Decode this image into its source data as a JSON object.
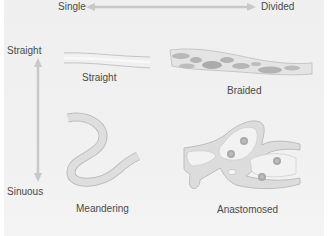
{
  "diagram": {
    "axes": {
      "horizontal": {
        "start_label": "Single",
        "end_label": "Divided"
      },
      "vertical": {
        "start_label": "Straight",
        "end_label": "Sinuous"
      }
    },
    "patterns": [
      {
        "id": "straight",
        "label": "Straight"
      },
      {
        "id": "braided",
        "label": "Braided"
      },
      {
        "id": "meandering",
        "label": "Meandering"
      },
      {
        "id": "anastomosed",
        "label": "Anastomosed"
      }
    ],
    "colors": {
      "background": "#efefef",
      "arrow": "#c8c8c8",
      "channel_fill": "#dcdcdc",
      "channel_edge": "#b8b8b8",
      "bar_fill": "#c4c4c4",
      "island_fill": "#ababab",
      "text": "#4a4a4a"
    }
  }
}
